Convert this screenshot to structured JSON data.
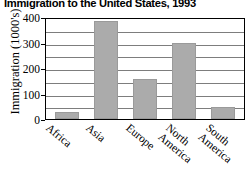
{
  "chart_data": {
    "type": "bar",
    "title": "Immigration to the United States, 1993",
    "xlabel": "",
    "ylabel": "Immigration (1000's)",
    "categories": [
      "Africa",
      "Asia",
      "Europe",
      "North America",
      "South America"
    ],
    "category_lines": [
      [
        "Africa"
      ],
      [
        "Asia"
      ],
      [
        "Europe"
      ],
      [
        "North",
        "America"
      ],
      [
        "South",
        "America"
      ]
    ],
    "values": [
      27,
      385,
      158,
      300,
      47
    ],
    "ylim": [
      0,
      400
    ],
    "yticks": [
      400,
      300,
      200,
      100,
      0
    ],
    "gridlines": [
      400,
      350,
      300,
      250,
      200,
      150,
      100,
      50,
      0
    ],
    "grid": true,
    "legend": "none",
    "bar_color": "#ababab",
    "frame_color": "#000000",
    "grid_color": "#7d7d7d"
  }
}
